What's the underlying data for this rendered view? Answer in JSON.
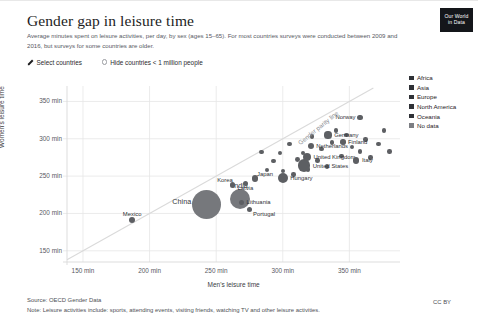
{
  "header": {
    "title": "Gender gap in leisure time",
    "subtitle": "Average minutes spent on leisure activities, per day, by sex (ages 15–65). For most countries surveys were conducted between 2009 and 2016, but surveys for some countries are older.",
    "logo_line1": "Our World",
    "logo_line2": "in Data"
  },
  "controls": {
    "select_countries_label": "Select countries",
    "select_countries_icon": "pencil-icon",
    "hide_countries_label": "Hide countries < 1 million people",
    "hide_countries_icon": "radio-unchecked-icon",
    "hide_countries_checked": false
  },
  "legend": {
    "items": [
      {
        "label": "Africa",
        "color": "#2f3136"
      },
      {
        "label": "Asia",
        "color": "#2f3136"
      },
      {
        "label": "Europe",
        "color": "#2f3136"
      },
      {
        "label": "North America",
        "color": "#2f3136"
      },
      {
        "label": "Oceania",
        "color": "#2f3136"
      },
      {
        "label": "No data",
        "color": "#7c7e83"
      }
    ]
  },
  "footer": {
    "source": "Source: OECD Gender Data",
    "note": "Note: Leisure activities include: sports, attending events, visiting friends, watching TV and other leisure activities.",
    "license": "CC BY"
  },
  "chart_data": {
    "type": "scatter",
    "title": "Gender gap in leisure time",
    "xlabel": "Men's leisure time",
    "ylabel": "Women's leisure time",
    "xticks": [
      "150 min",
      "200 min",
      "250 min",
      "300 min",
      "350 min"
    ],
    "yticks": [
      "150 min",
      "200 min",
      "250 min",
      "300 min",
      "350 min"
    ],
    "xtick_values": [
      150,
      200,
      250,
      300,
      350
    ],
    "ytick_values": [
      150,
      200,
      250,
      300,
      350
    ],
    "xlim": [
      138,
      388
    ],
    "ylim": [
      135,
      368
    ],
    "grid": true,
    "legend_position": "right",
    "annotations": [
      {
        "text": "Gender parity line",
        "rotation": -39
      }
    ],
    "size_encoding": "population",
    "points": [
      {
        "name": "Mexico",
        "x": 187,
        "y": 191,
        "r": 3.0,
        "label_pos": "above"
      },
      {
        "name": "China",
        "x": 243,
        "y": 212,
        "r": 14.5,
        "label_pos": "left-big"
      },
      {
        "name": "India",
        "x": 268,
        "y": 219,
        "r": 10.0,
        "label_pos": "above-big"
      },
      {
        "name": "Lithuania",
        "x": 269,
        "y": 215,
        "r": 2.6,
        "label_pos": "right"
      },
      {
        "name": "Portugal",
        "x": 275,
        "y": 205,
        "r": 2.6,
        "label_pos": "below-right"
      },
      {
        "name": "Korea",
        "x": 262,
        "y": 238,
        "r": 2.6,
        "label_pos": "above-left"
      },
      {
        "name": "Latvia",
        "x": 272,
        "y": 240,
        "r": 2.6,
        "label_pos": "below"
      },
      {
        "name": "Japan",
        "x": 279,
        "y": 247,
        "r": 3.2,
        "label_pos": "above-right"
      },
      {
        "name": "Hungary",
        "x": 300,
        "y": 247,
        "r": 5.0,
        "label_pos": "right"
      },
      {
        "name": "United States",
        "x": 316,
        "y": 264,
        "r": 6.2,
        "label_pos": "right"
      },
      {
        "name": "United Kingdom",
        "x": 318,
        "y": 276,
        "r": 4.2,
        "label_pos": "right"
      },
      {
        "name": "Netherlands",
        "x": 321,
        "y": 291,
        "r": 3.0,
        "label_pos": "right"
      },
      {
        "name": "Germany",
        "x": 334,
        "y": 305,
        "r": 3.6,
        "label_pos": "right"
      },
      {
        "name": "Finland",
        "x": 345,
        "y": 296,
        "r": 2.8,
        "label_pos": "right"
      },
      {
        "name": "Italy",
        "x": 355,
        "y": 271,
        "r": 3.4,
        "label_pos": "right"
      },
      {
        "name": "Norway",
        "x": 358,
        "y": 329,
        "r": 2.6,
        "label_pos": "left"
      }
    ],
    "unlabeled_points": [
      {
        "x": 288,
        "y": 258,
        "r": 2.2
      },
      {
        "x": 293,
        "y": 270,
        "r": 2.2
      },
      {
        "x": 298,
        "y": 281,
        "r": 2.2
      },
      {
        "x": 300,
        "y": 257,
        "r": 2.2
      },
      {
        "x": 305,
        "y": 293,
        "r": 2.2
      },
      {
        "x": 308,
        "y": 252,
        "r": 2.2
      },
      {
        "x": 311,
        "y": 272,
        "r": 2.4
      },
      {
        "x": 315,
        "y": 281,
        "r": 2.2
      },
      {
        "x": 319,
        "y": 259,
        "r": 2.2
      },
      {
        "x": 322,
        "y": 303,
        "r": 2.4
      },
      {
        "x": 326,
        "y": 271,
        "r": 2.2
      },
      {
        "x": 329,
        "y": 286,
        "r": 2.2
      },
      {
        "x": 333,
        "y": 263,
        "r": 2.2
      },
      {
        "x": 337,
        "y": 295,
        "r": 2.2
      },
      {
        "x": 340,
        "y": 311,
        "r": 2.2
      },
      {
        "x": 344,
        "y": 277,
        "r": 2.2
      },
      {
        "x": 348,
        "y": 305,
        "r": 2.4
      },
      {
        "x": 352,
        "y": 289,
        "r": 2.2
      },
      {
        "x": 358,
        "y": 283,
        "r": 2.2
      },
      {
        "x": 362,
        "y": 299,
        "r": 2.2
      },
      {
        "x": 366,
        "y": 275,
        "r": 2.2
      },
      {
        "x": 372,
        "y": 293,
        "r": 2.2
      },
      {
        "x": 376,
        "y": 311,
        "r": 2.2
      },
      {
        "x": 380,
        "y": 283,
        "r": 2.2
      },
      {
        "x": 284,
        "y": 282,
        "r": 2.2
      }
    ]
  }
}
